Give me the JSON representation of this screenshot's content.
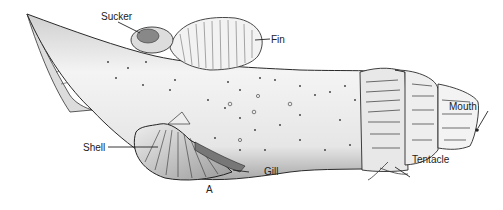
{
  "figure": {
    "panel_letter": "A",
    "labels": {
      "sucker": "Sucker",
      "fin": "Fin",
      "mouth": "Mouth",
      "shell": "Shell",
      "gill": "Gill",
      "tentacle": "Tentacle"
    },
    "colors": {
      "ink": "#222222",
      "shade": "#8a8a8a",
      "paper": "#ffffff"
    }
  }
}
